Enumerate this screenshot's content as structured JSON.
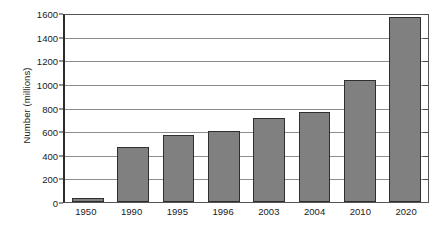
{
  "chart_data": {
    "type": "bar",
    "title": "",
    "xlabel": "",
    "ylabel": "Number (millions)",
    "categories": [
      "1950",
      "1990",
      "1995",
      "1996",
      "2003",
      "2004",
      "2010",
      "2020"
    ],
    "values": [
      30,
      465,
      570,
      605,
      710,
      765,
      1030,
      1570
    ],
    "ylim": [
      0,
      1600
    ],
    "ytick_step": 200,
    "yticks": [
      0,
      200,
      400,
      600,
      800,
      1000,
      1200,
      1400,
      1600
    ],
    "ytick_labels": [
      "0",
      "200",
      "400",
      "600",
      "800",
      "1000",
      "1200",
      "1400",
      "1600"
    ],
    "grid": true,
    "grid_axis": "y",
    "legend": false,
    "legend_position": "none",
    "bar_color": "#808080",
    "bar_edge_color": "#2f2f2f",
    "gridline_color": "#8c8c8c",
    "axis_color": "#2b2b2b",
    "background_color": "#ffffff",
    "series": [
      {
        "name": "Number (millions)",
        "values": [
          30,
          465,
          570,
          605,
          710,
          765,
          1030,
          1570
        ]
      }
    ]
  }
}
